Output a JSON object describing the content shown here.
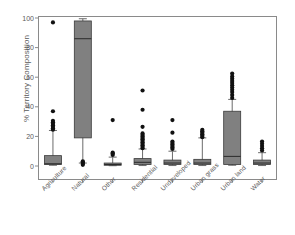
{
  "chart_data": {
    "type": "box",
    "title": "",
    "xlabel": "",
    "ylabel": "% Territory Composition",
    "ylim": [
      0,
      100
    ],
    "yticks": [
      0,
      20,
      40,
      60,
      80,
      100
    ],
    "grid": false,
    "legend": "none",
    "box_fill_color": "#808080",
    "box_edge_color": "#3a3a3a",
    "outlier_color": "#111111",
    "axis_color": "#8a8a8a",
    "categories": [
      "Agriculture",
      "Natural",
      "Other",
      "Residential",
      "Undeveloped",
      "Urban grass",
      "Urban land",
      "Water"
    ],
    "boxes": [
      {
        "category": "Agriculture",
        "whisker_low": 0.5,
        "q1": 1.0,
        "median": 1.5,
        "q3": 7.0,
        "whisker_high": 24.0,
        "outliers": [
          24.5,
          25.5,
          26.5,
          27.5,
          28.5,
          29.5,
          30.5,
          37.0,
          97.0
        ]
      },
      {
        "category": "Natural",
        "whisker_low": 2.0,
        "q1": 19.0,
        "median": 86.0,
        "q3": 98.0,
        "whisker_high": 99.5,
        "outliers": [
          0.8,
          1.5,
          2.5,
          3.2
        ]
      },
      {
        "category": "Other",
        "whisker_low": 0.2,
        "q1": 0.5,
        "median": 1.0,
        "q3": 2.0,
        "whisker_high": 6.0,
        "outliers": [
          7.5,
          8.5,
          9.0,
          31.0
        ]
      },
      {
        "category": "Residential",
        "whisker_low": 0.3,
        "q1": 1.0,
        "median": 2.5,
        "q3": 5.0,
        "whisker_high": 11.5,
        "outliers": [
          12.0,
          13.0,
          14.0,
          15.0,
          16.0,
          17.0,
          18.0,
          19.0,
          20.0,
          21.0,
          22.0,
          26.5,
          38.0,
          51.0
        ]
      },
      {
        "category": "Undeveloped",
        "whisker_low": 0.3,
        "q1": 1.0,
        "median": 2.0,
        "q3": 4.0,
        "whisker_high": 10.0,
        "outliers": [
          11.5,
          12.5,
          13.5,
          14.5,
          15.5,
          16.5,
          22.5,
          31.0
        ]
      },
      {
        "category": "Urban grass",
        "whisker_low": 0.3,
        "q1": 1.0,
        "median": 2.0,
        "q3": 4.5,
        "whisker_high": 19.0,
        "outliers": [
          19.5,
          20.5,
          21.5,
          22.5,
          23.5,
          24.5
        ]
      },
      {
        "category": "Urban land",
        "whisker_low": 0.5,
        "q1": 1.0,
        "median": 6.5,
        "q3": 37.0,
        "whisker_high": 45.0,
        "outliers": [
          46.0,
          48.0,
          50.0,
          51.5,
          53.0,
          54.5,
          56.0,
          57.5,
          59.0,
          60.5,
          62.5
        ]
      },
      {
        "category": "Water",
        "whisker_low": 0.3,
        "q1": 1.0,
        "median": 2.0,
        "q3": 4.0,
        "whisker_high": 9.0,
        "outliers": [
          10.5,
          12.0,
          13.5,
          15.0,
          16.5
        ]
      }
    ]
  }
}
